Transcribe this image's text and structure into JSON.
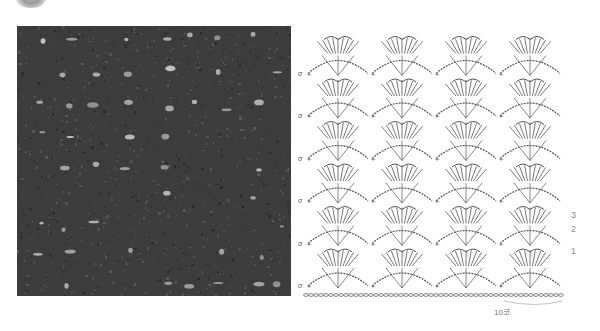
{
  "logo": {
    "icon": "circular-logo-icon"
  },
  "photo": {
    "alt": "dark crochet swatch with openwork shell pattern",
    "base_color": "#3c3c3c",
    "highlight_color": "#c8c8c8"
  },
  "chart": {
    "line_color": "#555555",
    "repeats_across": 4,
    "pattern_rows": 6,
    "row_numbers": [
      {
        "label": "1",
        "x": 571,
        "y": 252
      },
      {
        "label": "2",
        "x": 571,
        "y": 228
      },
      {
        "label": "3",
        "x": 571,
        "y": 214
      }
    ],
    "repeat_width_label": "10코",
    "symbols": {
      "chain": "ㅇ",
      "single_crochet": "+",
      "double_crochet": "T"
    }
  }
}
